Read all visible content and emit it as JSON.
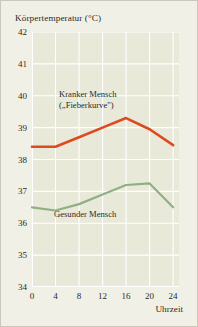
{
  "chart_data": {
    "type": "line",
    "title": "Körpertemperatur (°C)",
    "xlabel": "Uhrzeit",
    "ylabel": "Körpertemperatur (°C)",
    "xlim": [
      0,
      25
    ],
    "ylim": [
      34,
      42
    ],
    "grid": true,
    "legend": "in-plot annotations",
    "x": [
      0,
      4,
      8,
      12,
      16,
      20,
      24
    ],
    "xticks": [
      "0",
      "4",
      "8",
      "12",
      "16",
      "20",
      "24"
    ],
    "yticks": [
      "34",
      "35",
      "36",
      "37",
      "38",
      "39",
      "40",
      "41",
      "42"
    ],
    "series": [
      {
        "name": "Kranker Mensch („Fieberkurve\")",
        "color": "#dd4a1e",
        "values": [
          38.4,
          38.4,
          38.7,
          39.0,
          39.3,
          38.95,
          38.45
        ]
      },
      {
        "name": "Gesunder Mensch",
        "color": "#8fb083",
        "values": [
          36.5,
          36.4,
          36.6,
          36.9,
          37.2,
          37.25,
          36.5
        ]
      }
    ],
    "annotations": [
      {
        "id": "sick",
        "line1": "Kranker Mensch",
        "line2": "(„Fieberkurve\")"
      },
      {
        "id": "well",
        "line1": "Gesunder Mensch"
      }
    ],
    "colors": {
      "background": "#f1f0e6",
      "plot_background": "#e9e9da",
      "gridline": "#ffffff",
      "axis": "#ffffff",
      "text": "#2a2a26",
      "series_sick": "#dd4a1e",
      "series_healthy": "#8fb083"
    }
  }
}
